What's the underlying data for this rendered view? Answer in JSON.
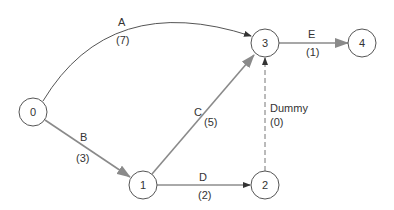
{
  "diagram": {
    "type": "activity-on-arrow network",
    "colors": {
      "node_stroke": "#555555",
      "thin_edge": "#555555",
      "thick_edge": "#8a8a8a",
      "dummy_edge": "#777777",
      "text": "#333333"
    },
    "nodes": [
      {
        "id": "0",
        "label": "0",
        "x": 33,
        "y": 112
      },
      {
        "id": "1",
        "label": "1",
        "x": 143,
        "y": 185
      },
      {
        "id": "2",
        "label": "2",
        "x": 265,
        "y": 185
      },
      {
        "id": "3",
        "label": "3",
        "x": 265,
        "y": 43
      },
      {
        "id": "4",
        "label": "4",
        "x": 362,
        "y": 43
      }
    ],
    "edges": [
      {
        "id": "A",
        "from": "0",
        "to": "3",
        "activity": "A",
        "duration": "(7)"
      },
      {
        "id": "B",
        "from": "0",
        "to": "1",
        "activity": "B",
        "duration": "(3)"
      },
      {
        "id": "C",
        "from": "1",
        "to": "3",
        "activity": "C",
        "duration": "(5)"
      },
      {
        "id": "D",
        "from": "1",
        "to": "2",
        "activity": "D",
        "duration": "(2)"
      },
      {
        "id": "Dummy",
        "from": "2",
        "to": "3",
        "activity": "Dummy",
        "duration": "(0)"
      },
      {
        "id": "E",
        "from": "3",
        "to": "4",
        "activity": "E",
        "duration": "(1)"
      }
    ]
  }
}
